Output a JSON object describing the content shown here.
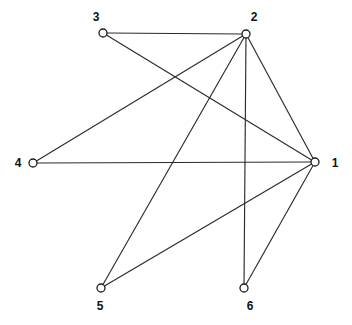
{
  "figure": {
    "name": "undirected-graph-diagram",
    "background_color": "#ffffff",
    "edge_color": "#2b2b2b",
    "vertex_fill_color": "#ffffff",
    "vertex_stroke_color": "#1c1c1c",
    "label_color": "#111111"
  },
  "chart_data": {
    "type": "diagram",
    "title": "",
    "xlabel": "",
    "ylabel": "",
    "grid": false,
    "legend": false,
    "graph_kind": "undirected-simple-graph",
    "vertex_count": 6,
    "edge_count": 9,
    "nodes": [
      {
        "id": "1",
        "label": "1",
        "x": 315,
        "y": 162,
        "label_x": 335,
        "label_y": 163,
        "degree": 5
      },
      {
        "id": "2",
        "label": "2",
        "x": 246,
        "y": 34,
        "label_x": 254,
        "label_y": 17,
        "degree": 5
      },
      {
        "id": "3",
        "label": "3",
        "x": 103,
        "y": 33,
        "label_x": 96,
        "label_y": 17,
        "degree": 2
      },
      {
        "id": "4",
        "label": "4",
        "x": 33,
        "y": 163,
        "label_x": 18,
        "label_y": 163,
        "degree": 2
      },
      {
        "id": "5",
        "label": "5",
        "x": 101,
        "y": 288,
        "label_x": 100,
        "label_y": 306,
        "degree": 2
      },
      {
        "id": "6",
        "label": "6",
        "x": 244,
        "y": 288,
        "label_x": 250,
        "label_y": 306,
        "degree": 2
      }
    ],
    "edges": [
      {
        "source": "3",
        "target": "2"
      },
      {
        "source": "3",
        "target": "1"
      },
      {
        "source": "4",
        "target": "2"
      },
      {
        "source": "4",
        "target": "1"
      },
      {
        "source": "5",
        "target": "2"
      },
      {
        "source": "5",
        "target": "1"
      },
      {
        "source": "6",
        "target": "2"
      },
      {
        "source": "6",
        "target": "1"
      },
      {
        "source": "2",
        "target": "1"
      }
    ],
    "adjacency": {
      "1": [
        "2",
        "3",
        "4",
        "5",
        "6"
      ],
      "2": [
        "1",
        "3",
        "4",
        "5",
        "6"
      ],
      "3": [
        "1",
        "2"
      ],
      "4": [
        "1",
        "2"
      ],
      "5": [
        "1",
        "2"
      ],
      "6": [
        "1",
        "2"
      ]
    }
  }
}
